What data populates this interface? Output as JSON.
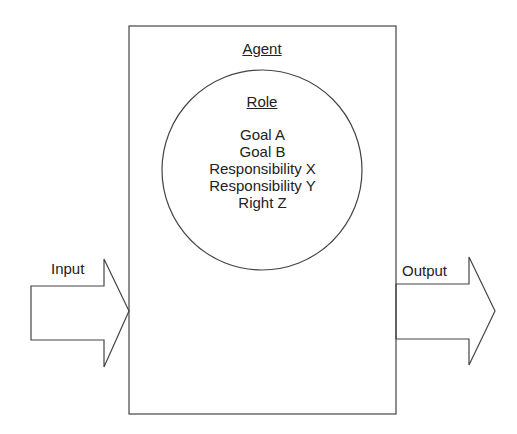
{
  "agent": {
    "title": "Agent"
  },
  "role": {
    "title": "Role",
    "items": [
      "Goal A",
      "Goal B",
      "Responsibility X",
      "Responsibility Y",
      "Right Z"
    ]
  },
  "input": {
    "label": "Input"
  },
  "output": {
    "label": "Output"
  },
  "colors": {
    "stroke": "#444444",
    "text": "#222222",
    "background": "#ffffff"
  }
}
